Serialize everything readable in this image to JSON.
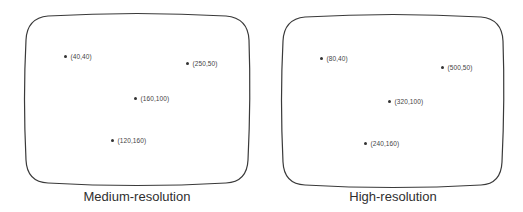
{
  "figure": {
    "panels": [
      {
        "id": "medium",
        "caption": "Medium-resolution",
        "screen": {
          "left": 26,
          "top": 13,
          "right": 249,
          "bottom": 184
        },
        "caption_center_x": 137,
        "points": [
          {
            "label": "(40,40)",
            "x": 65,
            "y": 56
          },
          {
            "label": "(250,50)",
            "x": 187,
            "y": 63
          },
          {
            "label": "(160,100)",
            "x": 135,
            "y": 98
          },
          {
            "label": "(120,160)",
            "x": 112,
            "y": 140
          }
        ]
      },
      {
        "id": "high",
        "caption": "High-resolution",
        "screen": {
          "left": 283,
          "top": 14,
          "right": 503,
          "bottom": 186
        },
        "caption_center_x": 393,
        "points": [
          {
            "label": "(80,40)",
            "x": 321,
            "y": 58
          },
          {
            "label": "(500,50)",
            "x": 442,
            "y": 67
          },
          {
            "label": "(320,100)",
            "x": 389,
            "y": 101
          },
          {
            "label": "(240,160)",
            "x": 365,
            "y": 143
          }
        ]
      }
    ]
  },
  "colors": {
    "outline": "#3a3a3a",
    "dot": "#333333",
    "text": "#2f2f2f"
  }
}
